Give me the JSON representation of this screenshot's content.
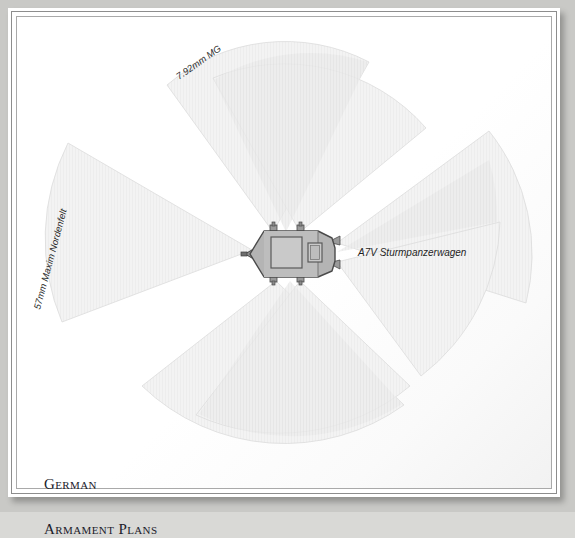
{
  "page": {
    "title_lines": [
      "German",
      "Armament Plans"
    ],
    "background_color": "#ffffff",
    "board_color": "#c9c9c6",
    "frame_color": "#8d8d8d"
  },
  "diagram": {
    "type": "firing-arc-plan",
    "subject_label": "A7V Sturmpanzerwagen",
    "vehicle": {
      "name": "A7V Sturmpanzerwagen",
      "body_fill": "#b4b4b4",
      "body_stroke": "#4a4a4a",
      "hatch_fill": "#c6c6c6"
    },
    "weapons": [
      {
        "id": "main-gun",
        "label": "57mm Maxim Nordenfelt",
        "label_visible": true
      },
      {
        "id": "mg-front",
        "label": "7.92mm MG",
        "label_visible": true
      },
      {
        "id": "mg-rear",
        "label": "7.92mm MG",
        "label_visible": false
      }
    ],
    "labels": {
      "mg": "7.92mm MG",
      "main_gun": "57mm Maxim Nordenfelt",
      "vehicle": "A7V Sturmpanzerwagen"
    },
    "arcs": {
      "count": 6,
      "fill": "#f1f1f1",
      "stroke": "#d6d6d6",
      "description": "six pale grey fields of fire radiating from the machine-gun and main-gun positions"
    }
  }
}
